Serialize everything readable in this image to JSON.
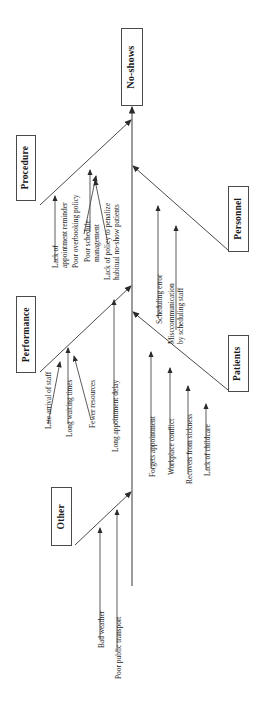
{
  "diagram": {
    "type": "fishbone-ishikawa",
    "orientation": "rotated-90-ccw",
    "effect": {
      "label": "No-shows"
    },
    "categories": [
      {
        "id": "procedure",
        "label": "Procedure",
        "side": "left",
        "causes": [
          "Lack of\nappointment reminder",
          "Poor overbooking policy",
          "Poor schedule\nmanagement",
          "Lack of policy to penalize\nhabitual no-show patients"
        ]
      },
      {
        "id": "performance",
        "label": "Performance",
        "side": "left",
        "causes": [
          "Late arrival of staff",
          "Long waiting times",
          "Fewer resources",
          "Long appointment delay"
        ]
      },
      {
        "id": "other",
        "label": "Other",
        "side": "left",
        "causes": [
          "Bad weather",
          "Poor public transport"
        ]
      },
      {
        "id": "personnel",
        "label": "Personnel",
        "side": "right",
        "causes": [
          "Scheduling error",
          "Misccommunication\nby scheduling staff"
        ]
      },
      {
        "id": "patients",
        "label": "Patients",
        "side": "right",
        "causes": [
          "Forgets appointment",
          "Workplace conflict",
          "Recovers from sickness",
          "Lack of childcare"
        ]
      }
    ],
    "labels": {
      "effect": "No-shows",
      "cat_procedure": "Procedure",
      "cat_performance": "Performance",
      "cat_other": "Other",
      "cat_personnel": "Personnel",
      "cat_patients": "Patients",
      "proc_c1a": "Lack of",
      "proc_c1b": "appointment reminder",
      "proc_c2": "Poor overbooking policy",
      "proc_c3a": "Poor schedule",
      "proc_c3b": "management",
      "proc_c4a": "Lack of policy to penalize",
      "proc_c4b": "habitual no-show patients",
      "perf_c1": "Late arrival of staff",
      "perf_c2": "Long waiting times",
      "perf_c3": "Fewer resources",
      "perf_c4": "Long appointment delay",
      "other_c1": "Bad weather",
      "other_c2": "Poor public transport",
      "pers_c1": "Scheduling error",
      "pers_c2a": "Misccommunication",
      "pers_c2b": "by scheduling staff",
      "pat_c1": "Forgets appointment",
      "pat_c2": "Workplace conflict",
      "pat_c3": "Recovers from sickness",
      "pat_c4": "Lack of childcare"
    },
    "colors": {
      "line": "#4a4a4a",
      "text": "#1a1a1a",
      "background": "#ffffff"
    }
  }
}
